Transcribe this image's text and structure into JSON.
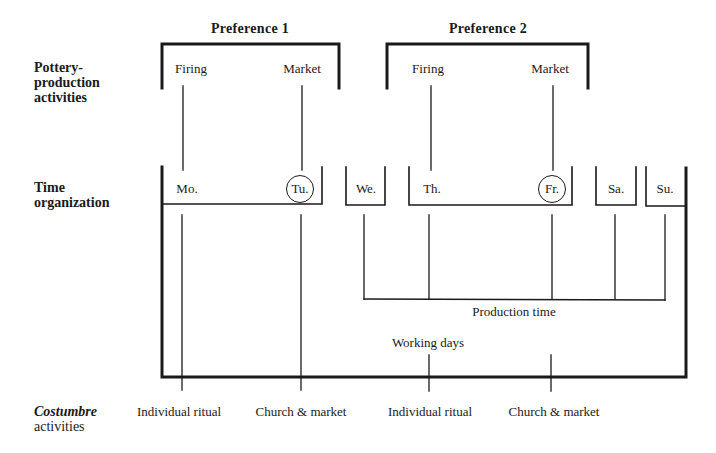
{
  "row_labels": {
    "pottery": [
      "Pottery-",
      "production",
      "activities"
    ],
    "time": [
      "Time",
      "organization"
    ],
    "costumbre_italic": "Costumbre",
    "costumbre_rest": "activities"
  },
  "preferences": [
    {
      "title": "Preference 1",
      "firing": "Firing",
      "market": "Market"
    },
    {
      "title": "Preference 2",
      "firing": "Firing",
      "market": "Market"
    }
  ],
  "days": [
    {
      "label": "Mo.",
      "circled": false
    },
    {
      "label": "Tu.",
      "circled": true
    },
    {
      "label": "We.",
      "circled": false
    },
    {
      "label": "Th.",
      "circled": false
    },
    {
      "label": "Fr.",
      "circled": true
    },
    {
      "label": "Sa.",
      "circled": false
    },
    {
      "label": "Su.",
      "circled": false
    }
  ],
  "spans": {
    "production_time": "Production time",
    "working_days": "Working days"
  },
  "costumbre": [
    {
      "label": "Individual ritual"
    },
    {
      "label": "Church & market"
    },
    {
      "label": "Individual ritual"
    },
    {
      "label": "Church & market"
    }
  ],
  "colors": {
    "ink": "#1a1a1a",
    "background": "#ffffff"
  }
}
